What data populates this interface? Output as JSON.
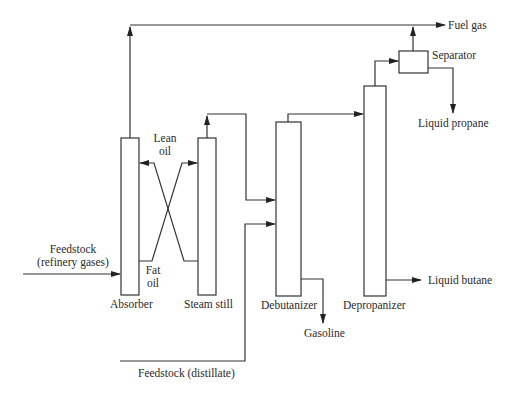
{
  "diagram": {
    "type": "process-flow",
    "units": {
      "absorber": "Absorber",
      "steam_still": "Steam still",
      "debutanizer": "Debutanizer",
      "depropanizer": "Depropanizer",
      "separator": "Separator"
    },
    "streams": {
      "fuel_gas": "Fuel gas",
      "liquid_propane": "Liquid propane",
      "liquid_butane": "Liquid butane",
      "gasoline": "Gasoline",
      "lean_oil_1": "Lean",
      "lean_oil_2": "oil",
      "fat_oil_1": "Fat",
      "fat_oil_2": "oil",
      "feed_gases_1": "Feedstock",
      "feed_gases_2": "(refinery gases)",
      "feed_distillate": "Feedstock (distillate)"
    },
    "colors": {
      "line": "#333333",
      "background": "#ffffff"
    }
  }
}
